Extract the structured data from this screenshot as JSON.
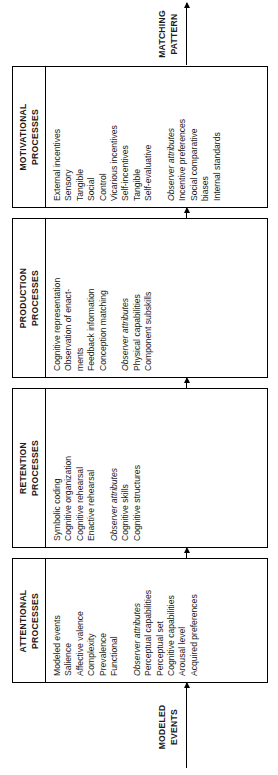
{
  "figure": {
    "orientation": "rotated-90-ccw",
    "input_label": "MODELED\nEVENTS",
    "input_label_line1": "MODELED",
    "input_label_line2": "EVENTS",
    "output_label_line1": "MATCHING",
    "output_label_line2": "PATTERN",
    "line_color": "#000000",
    "background_color": "#ffffff"
  },
  "stages": [
    {
      "title_line1": "ATTENTIONAL",
      "title_line2": "PROCESSES",
      "groups": [
        {
          "header": "Modeled events",
          "header_italic": false,
          "items": [
            "Salience",
            "Affective valence",
            "Complexity",
            "Prevalence",
            "Functional"
          ]
        },
        {
          "header": "Observer attributes",
          "header_italic": true,
          "items": [
            "Perceptual capabilities",
            "Perceptual set",
            "Cognitive capabilities",
            "Arousal level",
            "Acquired preferences"
          ]
        }
      ]
    },
    {
      "title_line1": "RETENTION",
      "title_line2": "PROCESSES",
      "groups": [
        {
          "header": "Symbolic coding",
          "header_italic": false,
          "items": [
            "Cognitive organization",
            "Cognitive rehearsal",
            "Enactive rehearsal"
          ]
        },
        {
          "header": "Observer attributes",
          "header_italic": true,
          "items": [
            "Cognitive skills",
            "Cognitive structures"
          ]
        }
      ]
    },
    {
      "title_line1": "PRODUCTION",
      "title_line2": "PROCESSES",
      "groups": [
        {
          "header": "Cognitive representation",
          "header_italic": false,
          "items": [
            "Observation of enact-",
            "ments",
            "Feedback information",
            "Conception matching"
          ]
        },
        {
          "header": "Observer attributes",
          "header_italic": true,
          "items": [
            "Physical capabilities",
            "Component subskills"
          ]
        }
      ]
    },
    {
      "title_line1": "MOTIVATIONAL",
      "title_line2": "PROCESSES",
      "groups": [
        {
          "header": "External incentives",
          "header_italic": false,
          "items": [
            "Sensory",
            "Tangible",
            "Social",
            "Control",
            "Vicarious incentives",
            "Self-incentives",
            "Tangible",
            "Self-evaluative"
          ]
        },
        {
          "header": "Observer attributes",
          "header_italic": true,
          "items": [
            "Incentive preferences",
            "Social comparative",
            "biases",
            "Internal standards"
          ]
        }
      ]
    }
  ]
}
